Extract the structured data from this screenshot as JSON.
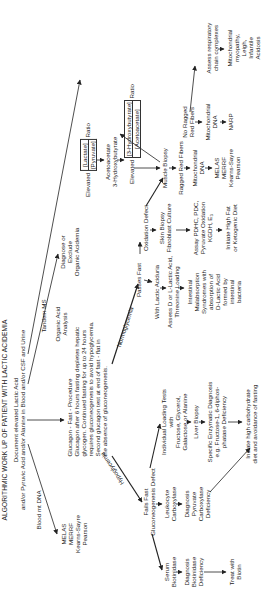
{
  "title": "ALGORITHMIC WORK UP OF PATIENT WITH LACTIC ACIDEMIA",
  "nodes": {
    "document": [
      "Document elevated Lactic Acid",
      "and/or Pyruvic Acid and/or Alanine in Blood and/or CSF and Urine"
    ],
    "blood_mt_dna": "Blood mt DNA",
    "mito_left": [
      "MELAS",
      "MERRF",
      "Kearns-Sayre",
      "Pearson"
    ],
    "tandem_ms": "Tandem MS",
    "organic_acid": [
      "Organic Acid",
      "Analysis"
    ],
    "diagnose_exclude": [
      "Diagnose or",
      "Exclude",
      "Organic Acidemia"
    ],
    "glucagon": [
      "Glucagon - Fast - Procedure",
      "Glucagon after 6 hours fasting depletes hepatic",
      "glycogen. Continued fasting for up to 24 hours",
      "requires gluconeogenesis to avoid hypoglycemia.",
      "Second glucagon test at end of fast - flat in",
      "the absence of gluconeogenesis."
    ],
    "elevated_lp": {
      "prefix": "Elevated",
      "num": "[Lactate]",
      "den": "[Pyruvate]",
      "suffix": "Ratio"
    },
    "aceto": [
      "Acetoacetate",
      "3-Hydroxybutyrate"
    ],
    "elevated_hb": {
      "prefix": "Elevated",
      "num": "[3-Hydroxybutyrate]",
      "den": "[Acetoacetate]",
      "suffix": "Ratio"
    },
    "muscle_biopsy": "Muscle Biopsy",
    "ragged": "Ragged Red Fibers",
    "no_ragged": [
      "No Ragged",
      "Red Fibers"
    ],
    "mito_dna_1": [
      "Mitochondrial",
      "DNA"
    ],
    "mito_dna_2": [
      "Mitochondrial",
      "DNA"
    ],
    "mito_right": [
      "MELAS",
      "MERRF",
      "Kearns-Sayre",
      "Pearson"
    ],
    "narp": "NARP",
    "resp_chain": [
      "Assess respiratory",
      "chain complexes"
    ],
    "mito_myopathy": [
      "Mitochondrial",
      "myopathy,",
      "Leigh,",
      "Infantile",
      "Acidosis"
    ],
    "normoglycemia": "Normoglycemia",
    "hypoglycemia": "Hypoglycemia",
    "passes_fast": "Passes Fast",
    "oxidation_defect": "Oxidation Defect",
    "skin_biopsy": [
      "Skin Biopsy",
      "Fibroblast Culture"
    ],
    "assay": [
      "Assay PDHC, PDC,",
      "Pyruvate Oxidation",
      "KGDH, E₃"
    ],
    "high_fat": [
      "Initiate High Fat",
      "or Ketogenic Diet"
    ],
    "with_lactic": "With Lactic Aciduria",
    "assess_d_l": [
      "Assess D or L-Lactic Acid,",
      "Threonine Loading"
    ],
    "intestinal": [
      "Intestinal",
      "Malabsorption",
      "Syndromes with",
      "absorption of",
      "D-Lactic Acid",
      "formed by",
      "intestinal",
      "bacteria"
    ],
    "fails_fast": [
      "Fails Fast",
      "Gluconeogenesis Defect"
    ],
    "loading_tests": [
      "Individual Loading Tests",
      "with",
      "Fructose, Glycerol,",
      "Galactose or Alanine"
    ],
    "liver_biopsy": "Liver Biopsy",
    "specific_enzyme": [
      "Specific Enzymatic Diagnosis",
      "e.g. Fructose-1, 6-diphos-",
      "phatase Deficiency"
    ],
    "high_carb": [
      "Initiate high carbohydrate",
      "diet and avoidance of fasting"
    ],
    "leukocyte": [
      "Leukocyte",
      "Carboxylase"
    ],
    "pyruvate_carb": [
      "Diagnosis",
      "Pyruvate",
      "Carboxylase",
      "Deficiency"
    ],
    "serum_biot": [
      "Serum",
      "Biotinidase"
    ],
    "biot_def": [
      "Diagnosis",
      "Biotinidase",
      "Deficiency"
    ],
    "treat_biotin": [
      "Treat with",
      "Biotin"
    ]
  }
}
